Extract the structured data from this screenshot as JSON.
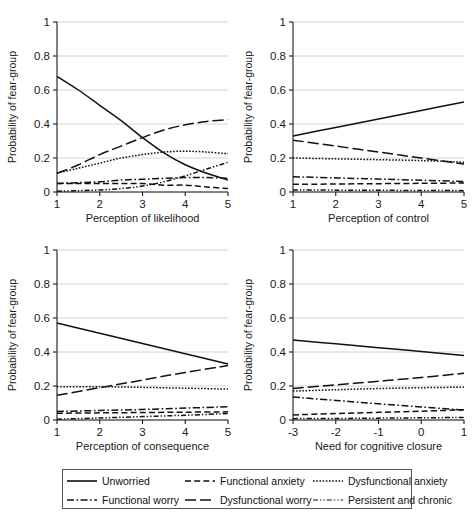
{
  "figure": {
    "ylabel": "Probability of fear-group",
    "ylim": [
      0,
      1
    ],
    "yticks": [
      "0",
      "0.2",
      "0.4",
      "0.6",
      "0.8",
      "1"
    ],
    "ytick_values": [
      0,
      0.2,
      0.4,
      0.6,
      0.8,
      1
    ]
  },
  "legend": {
    "items": [
      {
        "label": "Unworried",
        "style": "solid",
        "key": "legend-key-unworried"
      },
      {
        "label": "Functional anxiety",
        "style": "dashed",
        "key": "legend-key-functional-anxiety"
      },
      {
        "label": "Dysfunctional anxiety",
        "style": "dotted",
        "key": "legend-key-dysfunctional-anxiety"
      },
      {
        "label": "Functional worry",
        "style": "dashdot",
        "key": "legend-key-functional-worry"
      },
      {
        "label": "Dysfunctional worry",
        "style": "longdash",
        "key": "legend-key-dysfunctional-worry"
      },
      {
        "label": "Persistent and chronic",
        "style": "dashdotdot",
        "key": "legend-key-persistent-chronic"
      }
    ]
  },
  "chart_data": [
    {
      "type": "line",
      "panel": "top-left",
      "title": "",
      "xlabel": "Perception of likelihood",
      "ylabel": "Probability of fear-group",
      "xlim": [
        1,
        5
      ],
      "ylim": [
        0,
        1
      ],
      "xticks": [
        "1",
        "2",
        "3",
        "4",
        "5"
      ],
      "xtick_values": [
        1,
        2,
        3,
        4,
        5
      ],
      "yticks": [
        "0",
        "0.2",
        "0.4",
        "0.6",
        "0.8",
        "1"
      ],
      "grid": true,
      "x": [
        1,
        1.5,
        2,
        2.5,
        3,
        3.5,
        4,
        4.5,
        5
      ],
      "series": [
        {
          "name": "Unworried",
          "style": "solid",
          "values": [
            0.68,
            0.6,
            0.51,
            0.42,
            0.32,
            0.23,
            0.16,
            0.11,
            0.07
          ]
        },
        {
          "name": "Functional anxiety",
          "style": "dashed",
          "values": [
            0.05,
            0.05,
            0.05,
            0.05,
            0.05,
            0.04,
            0.04,
            0.03,
            0.02
          ]
        },
        {
          "name": "Dysfunctional anxiety",
          "style": "dotted",
          "values": [
            0.11,
            0.14,
            0.17,
            0.2,
            0.22,
            0.235,
            0.24,
            0.235,
            0.225
          ]
        },
        {
          "name": "Functional worry",
          "style": "dashdot",
          "values": [
            0.05,
            0.055,
            0.06,
            0.07,
            0.075,
            0.08,
            0.085,
            0.085,
            0.08
          ]
        },
        {
          "name": "Dysfunctional worry",
          "style": "longdash",
          "values": [
            0.11,
            0.16,
            0.22,
            0.27,
            0.32,
            0.365,
            0.395,
            0.415,
            0.425
          ]
        },
        {
          "name": "Persistent and chronic",
          "style": "dashdotdot",
          "values": [
            0.005,
            0.008,
            0.012,
            0.02,
            0.035,
            0.06,
            0.095,
            0.135,
            0.175
          ]
        }
      ]
    },
    {
      "type": "line",
      "panel": "top-right",
      "title": "",
      "xlabel": "Perception of control",
      "ylabel": "Probability of fear-group",
      "xlim": [
        1,
        5
      ],
      "ylim": [
        0,
        1
      ],
      "xticks": [
        "1",
        "2",
        "3",
        "4",
        "5"
      ],
      "xtick_values": [
        1,
        2,
        3,
        4,
        5
      ],
      "yticks": [
        "0",
        "0.2",
        "0.4",
        "0.6",
        "0.8",
        "1"
      ],
      "grid": true,
      "x": [
        1,
        2,
        3,
        4,
        5
      ],
      "series": [
        {
          "name": "Unworried",
          "style": "solid",
          "values": [
            0.33,
            0.38,
            0.43,
            0.48,
            0.53
          ]
        },
        {
          "name": "Functional anxiety",
          "style": "dashed",
          "values": [
            0.045,
            0.047,
            0.049,
            0.051,
            0.053
          ]
        },
        {
          "name": "Dysfunctional anxiety",
          "style": "dotted",
          "values": [
            0.2,
            0.195,
            0.19,
            0.185,
            0.175
          ]
        },
        {
          "name": "Functional worry",
          "style": "dashdot",
          "values": [
            0.09,
            0.083,
            0.076,
            0.069,
            0.062
          ]
        },
        {
          "name": "Dysfunctional worry",
          "style": "longdash",
          "values": [
            0.305,
            0.27,
            0.235,
            0.2,
            0.165
          ]
        },
        {
          "name": "Persistent and chronic",
          "style": "dashdotdot",
          "values": [
            0.012,
            0.011,
            0.01,
            0.009,
            0.008
          ]
        }
      ]
    },
    {
      "type": "line",
      "panel": "bottom-left",
      "title": "",
      "xlabel": "Perception of consequence",
      "ylabel": "Probability of fear-group",
      "xlim": [
        1,
        5
      ],
      "ylim": [
        0,
        1
      ],
      "xticks": [
        "1",
        "2",
        "3",
        "4",
        "5"
      ],
      "xtick_values": [
        1,
        2,
        3,
        4,
        5
      ],
      "yticks": [
        "0",
        "0.2",
        "0.4",
        "0.6",
        "0.8",
        "1"
      ],
      "grid": true,
      "x": [
        1,
        2,
        3,
        4,
        5
      ],
      "series": [
        {
          "name": "Unworried",
          "style": "solid",
          "values": [
            0.57,
            0.51,
            0.45,
            0.39,
            0.33
          ]
        },
        {
          "name": "Functional anxiety",
          "style": "dashed",
          "values": [
            0.04,
            0.042,
            0.044,
            0.046,
            0.048
          ]
        },
        {
          "name": "Dysfunctional anxiety",
          "style": "dotted",
          "values": [
            0.195,
            0.196,
            0.192,
            0.187,
            0.182
          ]
        },
        {
          "name": "Functional worry",
          "style": "dashdot",
          "values": [
            0.05,
            0.056,
            0.062,
            0.07,
            0.078
          ]
        },
        {
          "name": "Dysfunctional worry",
          "style": "longdash",
          "values": [
            0.145,
            0.19,
            0.235,
            0.28,
            0.32
          ]
        },
        {
          "name": "Persistent and chronic",
          "style": "dashdotdot",
          "values": [
            0.005,
            0.012,
            0.02,
            0.028,
            0.038
          ]
        }
      ]
    },
    {
      "type": "line",
      "panel": "bottom-right",
      "title": "",
      "xlabel": "Need for cognitive closure",
      "ylabel": "Probability of fear-group",
      "xlim": [
        -3,
        1
      ],
      "ylim": [
        0,
        1
      ],
      "xticks": [
        "-3",
        "-2",
        "-1",
        "0",
        "1"
      ],
      "xtick_values": [
        -3,
        -2,
        -1,
        0,
        1
      ],
      "yticks": [
        "0",
        "0.2",
        "0.4",
        "0.6",
        "0.8",
        "1"
      ],
      "grid": true,
      "x": [
        -3,
        -2,
        -1,
        0,
        1
      ],
      "series": [
        {
          "name": "Unworried",
          "style": "solid",
          "values": [
            0.47,
            0.448,
            0.425,
            0.403,
            0.38
          ]
        },
        {
          "name": "Functional anxiety",
          "style": "dashed",
          "values": [
            0.03,
            0.038,
            0.045,
            0.052,
            0.06
          ]
        },
        {
          "name": "Dysfunctional anxiety",
          "style": "dotted",
          "values": [
            0.17,
            0.178,
            0.185,
            0.19,
            0.193
          ]
        },
        {
          "name": "Functional worry",
          "style": "dashdot",
          "values": [
            0.135,
            0.115,
            0.095,
            0.077,
            0.058
          ]
        },
        {
          "name": "Dysfunctional worry",
          "style": "longdash",
          "values": [
            0.185,
            0.207,
            0.228,
            0.25,
            0.275
          ]
        },
        {
          "name": "Persistent and chronic",
          "style": "dashdotdot",
          "values": [
            0.008,
            0.009,
            0.011,
            0.013,
            0.015
          ]
        }
      ]
    }
  ]
}
